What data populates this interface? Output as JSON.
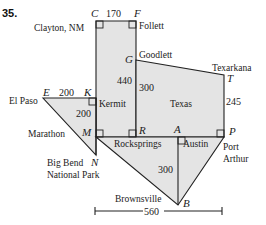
{
  "problem_number": "35.",
  "points": {
    "C": "C",
    "F": "F",
    "G": "G",
    "T": "T",
    "E": "E",
    "K": "K",
    "M": "M",
    "R": "R",
    "A": "A",
    "P": "P",
    "N": "N",
    "B": "B"
  },
  "cities": {
    "clayton": "Clayton, NM",
    "follett": "Follett",
    "goodlett": "Goodlett",
    "texarkana": "Texarkana",
    "el_paso": "El Paso",
    "kermit": "Kermit",
    "texas": "Texas",
    "marathon": "Marathon",
    "rocksprings": "Rocksprings",
    "austin": "Austin",
    "port_arthur_1": "Port",
    "port_arthur_2": "Arthur",
    "big_bend_1": "Big Bend",
    "big_bend_2": "National Park",
    "brownsville": "Brownsville"
  },
  "measurements": {
    "CF": "170",
    "CM_left": "440",
    "GR": "300",
    "TP": "245",
    "EK": "200",
    "KM": "200",
    "AB": "300",
    "width_total": "560"
  },
  "colors": {
    "fill": "#e4e4e4",
    "stroke": "#222222"
  }
}
